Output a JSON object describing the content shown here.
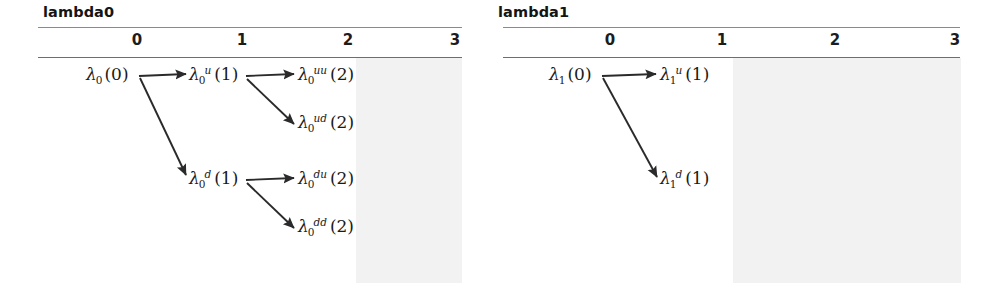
{
  "panels": [
    {
      "id": "lambda0",
      "title": "lambda0",
      "column_headers": [
        "0",
        "1",
        "2",
        "3"
      ],
      "nodes": [
        {
          "key": "root",
          "lambda": "λ",
          "sub": "0",
          "sup": "",
          "arg": "(0)",
          "step": 0
        },
        {
          "key": "u",
          "lambda": "λ",
          "sub": "0",
          "sup": "u",
          "arg": "(1)",
          "step": 1
        },
        {
          "key": "d",
          "lambda": "λ",
          "sub": "0",
          "sup": "d",
          "arg": "(1)",
          "step": 1
        },
        {
          "key": "uu",
          "lambda": "λ",
          "sub": "0",
          "sup": "uu",
          "arg": "(2)",
          "step": 2
        },
        {
          "key": "ud",
          "lambda": "λ",
          "sub": "0",
          "sup": "ud",
          "arg": "(2)",
          "step": 2
        },
        {
          "key": "du",
          "lambda": "λ",
          "sub": "0",
          "sup": "du",
          "arg": "(2)",
          "step": 2
        },
        {
          "key": "dd",
          "lambda": "λ",
          "sub": "0",
          "sup": "dd",
          "arg": "(2)",
          "step": 2
        }
      ],
      "edges": [
        {
          "from": "root",
          "to": "u",
          "direction": "up"
        },
        {
          "from": "root",
          "to": "d",
          "direction": "down"
        },
        {
          "from": "u",
          "to": "uu",
          "direction": "up"
        },
        {
          "from": "u",
          "to": "ud",
          "direction": "down"
        },
        {
          "from": "d",
          "to": "du",
          "direction": "up"
        },
        {
          "from": "d",
          "to": "dd",
          "direction": "down"
        }
      ]
    },
    {
      "id": "lambda1",
      "title": "lambda1",
      "column_headers": [
        "0",
        "1",
        "2",
        "3"
      ],
      "nodes": [
        {
          "key": "root",
          "lambda": "λ",
          "sub": "1",
          "sup": "",
          "arg": "(0)",
          "step": 0
        },
        {
          "key": "u",
          "lambda": "λ",
          "sub": "1",
          "sup": "u",
          "arg": "(1)",
          "step": 1
        },
        {
          "key": "d",
          "lambda": "λ",
          "sub": "1",
          "sup": "d",
          "arg": "(1)",
          "step": 1
        }
      ],
      "edges": [
        {
          "from": "root",
          "to": "u",
          "direction": "up"
        },
        {
          "from": "root",
          "to": "d",
          "direction": "down"
        }
      ]
    }
  ],
  "colors": {
    "shade": "#f2f2f2",
    "rule": "#8a8a8a",
    "text": "#1a1a1a",
    "arrow": "#2a2a2a",
    "background": "#ffffff"
  }
}
